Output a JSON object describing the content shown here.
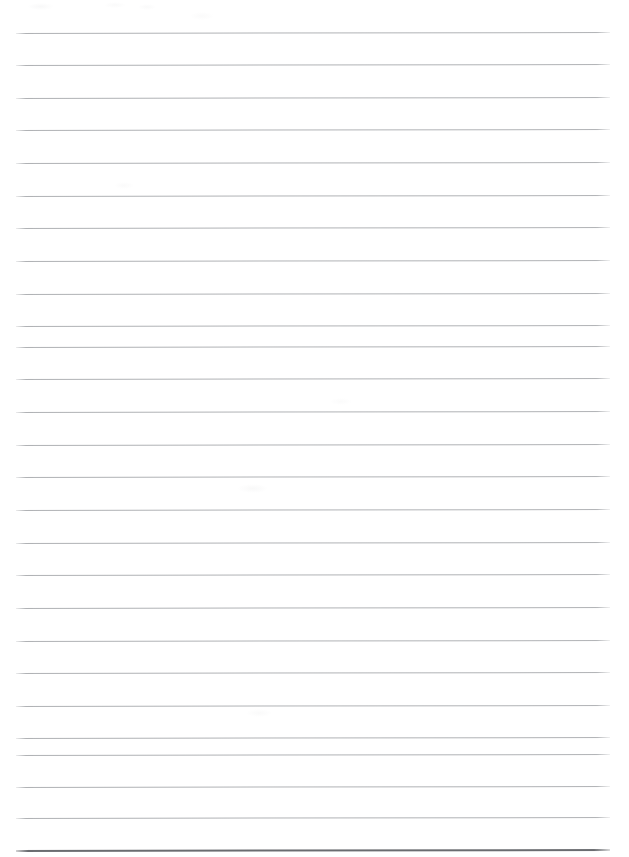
{
  "document": {
    "kind": "scanned-lined-paper",
    "title": "Blank ruled notebook page",
    "page_label": "",
    "text_content": "",
    "orientation": "portrait",
    "page_width_px": 629,
    "page_height_px": 857,
    "background_color": "#ffffff"
  },
  "ruling": {
    "line_color": "#b0b2b5",
    "heavy_line_color": "#6a6c70",
    "line_thickness_px": 1,
    "heavy_line_thickness_px": 2,
    "line_count": 26,
    "line_spacing_px": 32.5,
    "left_margin_px": 16,
    "right_edge_px": 610,
    "skew_degrees": -0.1,
    "lines_y_px": [
      33,
      65,
      98,
      130,
      163,
      196,
      228,
      261,
      294,
      326,
      347,
      379,
      412,
      445,
      477,
      510,
      543,
      575,
      608,
      641,
      673,
      706,
      738,
      755,
      787,
      818
    ],
    "heavy_line_y_px": 850
  },
  "artifacts": {
    "smudges": [
      {
        "x": 28,
        "y": 3,
        "w": 26,
        "h": 7,
        "opacity": 0.05
      },
      {
        "x": 104,
        "y": 2,
        "w": 22,
        "h": 6,
        "opacity": 0.04
      },
      {
        "x": 138,
        "y": 4,
        "w": 18,
        "h": 6,
        "opacity": 0.04
      },
      {
        "x": 190,
        "y": 12,
        "w": 24,
        "h": 8,
        "opacity": 0.035
      },
      {
        "x": 238,
        "y": 484,
        "w": 30,
        "h": 9,
        "opacity": 0.05
      },
      {
        "x": 114,
        "y": 182,
        "w": 20,
        "h": 7,
        "opacity": 0.035
      },
      {
        "x": 246,
        "y": 709,
        "w": 26,
        "h": 8,
        "opacity": 0.04
      },
      {
        "x": 330,
        "y": 398,
        "w": 22,
        "h": 7,
        "opacity": 0.03
      }
    ]
  }
}
